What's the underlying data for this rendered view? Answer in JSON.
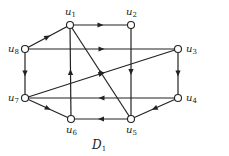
{
  "diagram": {
    "title": "D",
    "title_sub": "1",
    "nodes": [
      {
        "id": "u1",
        "label": "u",
        "sub": "1",
        "x": 70,
        "y": 25,
        "lx": 65,
        "ly": 15
      },
      {
        "id": "u2",
        "label": "u",
        "sub": "2",
        "x": 131,
        "y": 25,
        "lx": 126,
        "ly": 15
      },
      {
        "id": "u3",
        "label": "u",
        "sub": "3",
        "x": 178,
        "y": 49,
        "lx": 186,
        "ly": 52
      },
      {
        "id": "u4",
        "label": "u",
        "sub": "4",
        "x": 178,
        "y": 98,
        "lx": 186,
        "ly": 101
      },
      {
        "id": "u5",
        "label": "u",
        "sub": "5",
        "x": 131,
        "y": 119,
        "lx": 126,
        "ly": 133
      },
      {
        "id": "u6",
        "label": "u",
        "sub": "6",
        "x": 71,
        "y": 119,
        "lx": 66,
        "ly": 133
      },
      {
        "id": "u7",
        "label": "u",
        "sub": "7",
        "x": 25,
        "y": 98,
        "lx": 8,
        "ly": 101
      },
      {
        "id": "u8",
        "label": "u",
        "sub": "8",
        "x": 25,
        "y": 49,
        "lx": 8,
        "ly": 52
      }
    ],
    "edges": [
      {
        "from": "u1",
        "to": "u2"
      },
      {
        "from": "u8",
        "to": "u1"
      },
      {
        "from": "u8",
        "to": "u3"
      },
      {
        "from": "u8",
        "to": "u7"
      },
      {
        "from": "u2",
        "to": "u5"
      },
      {
        "from": "u3",
        "to": "u4"
      },
      {
        "from": "u7",
        "to": "u3"
      },
      {
        "from": "u4",
        "to": "u7"
      },
      {
        "from": "u4",
        "to": "u5"
      },
      {
        "from": "u5",
        "to": "u6"
      },
      {
        "from": "u5",
        "to": "u1"
      },
      {
        "from": "u6",
        "to": "u1"
      },
      {
        "from": "u7",
        "to": "u6"
      }
    ],
    "colors": {
      "stroke": "#222222",
      "node_fill": "#ffffff"
    }
  }
}
